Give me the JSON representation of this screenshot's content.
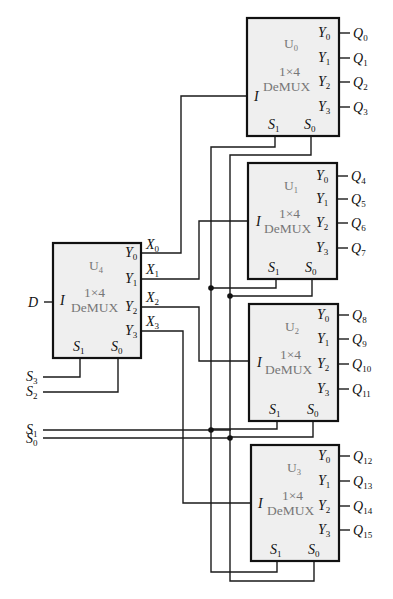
{
  "colors": {
    "wire": "#1a1a1a",
    "box_fill": "#efefef",
    "box_stroke": "#111111",
    "block_text": "#777777"
  },
  "blocks": [
    {
      "id": "U0",
      "name_main": "U",
      "name_sub": "0",
      "type_line1": "1×4",
      "type_line2": "DeMUX",
      "x": 247,
      "y": 18,
      "w": 92,
      "h": 118,
      "outputs": [
        {
          "q": "Q",
          "sub": "0"
        },
        {
          "q": "Q",
          "sub": "1"
        },
        {
          "q": "Q",
          "sub": "2"
        },
        {
          "q": "Q",
          "sub": "3"
        }
      ]
    },
    {
      "id": "U1",
      "name_main": "U",
      "name_sub": "1",
      "type_line1": "1×4",
      "type_line2": "DeMUX",
      "x": 248,
      "y": 163,
      "w": 89,
      "h": 116,
      "outputs": [
        {
          "q": "Q",
          "sub": "4"
        },
        {
          "q": "Q",
          "sub": "5"
        },
        {
          "q": "Q",
          "sub": "6"
        },
        {
          "q": "Q",
          "sub": "7"
        }
      ]
    },
    {
      "id": "U2",
      "name_main": "U",
      "name_sub": "2",
      "type_line1": "1×4",
      "type_line2": "DeMUX",
      "x": 249,
      "y": 304,
      "w": 89,
      "h": 117,
      "outputs": [
        {
          "q": "Q",
          "sub": "8"
        },
        {
          "q": "Q",
          "sub": "9"
        },
        {
          "q": "Q",
          "sub": "10"
        },
        {
          "q": "Q",
          "sub": "11"
        }
      ]
    },
    {
      "id": "U3",
      "name_main": "U",
      "name_sub": "3",
      "type_line1": "1×4",
      "type_line2": "DeMUX",
      "x": 251,
      "y": 445,
      "w": 88,
      "h": 116,
      "outputs": [
        {
          "q": "Q",
          "sub": "12"
        },
        {
          "q": "Q",
          "sub": "13"
        },
        {
          "q": "Q",
          "sub": "14"
        },
        {
          "q": "Q",
          "sub": "15"
        }
      ]
    },
    {
      "id": "U4",
      "name_main": "U",
      "name_sub": "4",
      "type_line1": "1×4",
      "type_line2": "DeMUX",
      "x": 53,
      "y": 243,
      "w": 88,
      "h": 115,
      "outputs": [
        {
          "q": "X",
          "sub": "0"
        },
        {
          "q": "X",
          "sub": "1"
        },
        {
          "q": "X",
          "sub": "2"
        },
        {
          "q": "X",
          "sub": "3"
        }
      ]
    }
  ],
  "pin_labels": {
    "input": "I",
    "y_main": "Y",
    "y_subs": [
      "0",
      "1",
      "2",
      "3"
    ],
    "s_main": "S",
    "s1_sub": "1",
    "s0_sub": "0"
  },
  "external_inputs": {
    "D": {
      "main": "D"
    },
    "S3": {
      "main": "S",
      "sub": "3"
    },
    "S2": {
      "main": "S",
      "sub": "2"
    },
    "S1": {
      "main": "S",
      "sub": "1"
    },
    "S0": {
      "main": "S",
      "sub": "0"
    }
  }
}
